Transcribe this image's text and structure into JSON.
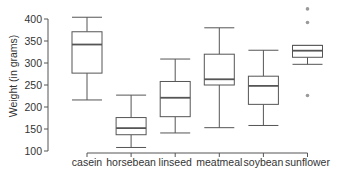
{
  "chart_data": {
    "type": "box",
    "title": "",
    "xlabel": "",
    "ylabel": "Weight (in grams)",
    "ylim": [
      100,
      400
    ],
    "yticks": [
      100,
      150,
      200,
      250,
      300,
      350,
      400
    ],
    "grid": false,
    "legend": null,
    "categories": [
      "casein",
      "horsebean",
      "linseed",
      "meatmeal",
      "soybean",
      "sunflower"
    ],
    "boxes": [
      {
        "name": "casein",
        "whisker_low": 216,
        "q1": 277,
        "median": 342,
        "q3": 371,
        "whisker_high": 404,
        "outliers": []
      },
      {
        "name": "horsebean",
        "whisker_low": 108,
        "q1": 137,
        "median": 152,
        "q3": 176,
        "whisker_high": 227,
        "outliers": []
      },
      {
        "name": "linseed",
        "whisker_low": 141,
        "q1": 178,
        "median": 221,
        "q3": 258,
        "whisker_high": 309,
        "outliers": []
      },
      {
        "name": "meatmeal",
        "whisker_low": 153,
        "q1": 250,
        "median": 263,
        "q3": 320,
        "whisker_high": 380,
        "outliers": []
      },
      {
        "name": "soybean",
        "whisker_low": 158,
        "q1": 206,
        "median": 248,
        "q3": 270,
        "whisker_high": 329,
        "outliers": []
      },
      {
        "name": "sunflower",
        "whisker_low": 297,
        "q1": 313,
        "median": 328,
        "q3": 340,
        "whisker_high": 340,
        "outliers": [
          423,
          392,
          226
        ]
      }
    ]
  },
  "style": {
    "line_color": "#555555",
    "outlier_color": "#9a9a9a",
    "axis_color": "#555555",
    "text_color": "#333333"
  }
}
